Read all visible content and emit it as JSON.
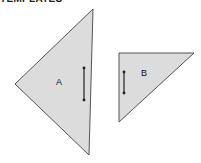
{
  "header": {
    "title": "TEMPLATES"
  },
  "shapes": [
    {
      "id": "A",
      "label": "A",
      "type": "triangle",
      "fill": "#dcdcdc",
      "stroke": "#555555",
      "points": [
        [
          93,
          9
        ],
        [
          15,
          84
        ],
        [
          89,
          155
        ]
      ],
      "arrow": {
        "x": 84,
        "y1": 68,
        "y2": 100
      }
    },
    {
      "id": "B",
      "label": "B",
      "type": "triangle",
      "fill": "#dcdcdc",
      "stroke": "#555555",
      "points": [
        [
          119,
          53
        ],
        [
          194,
          53
        ],
        [
          119,
          122
        ]
      ],
      "arrow": {
        "x": 124,
        "y1": 72,
        "y2": 93
      }
    }
  ]
}
